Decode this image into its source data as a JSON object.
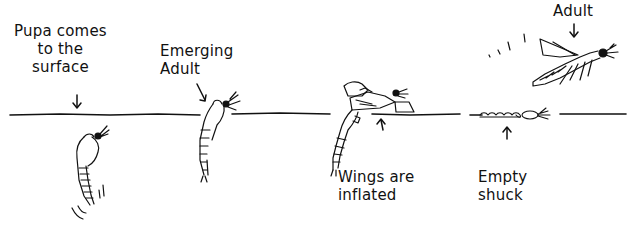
{
  "diagram": {
    "labels": [
      {
        "id": "pupa",
        "lines": [
          "Pupa comes",
          "to the",
          "surface"
        ]
      },
      {
        "id": "emerging",
        "lines": [
          "Emerging",
          "Adult"
        ]
      },
      {
        "id": "wings",
        "lines": [
          "Wings are",
          "inflated"
        ]
      },
      {
        "id": "shuck",
        "lines": [
          "Empty",
          "shuck"
        ]
      },
      {
        "id": "adult",
        "lines": [
          "Adult"
        ]
      }
    ],
    "colors": {
      "ink": "#111111",
      "background": "#ffffff"
    }
  }
}
